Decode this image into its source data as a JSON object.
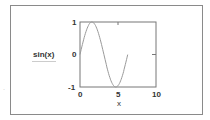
{
  "chart_data": {
    "type": "line",
    "title": "",
    "xlabel": "x",
    "ylabel": "sin(x)",
    "xlim": [
      0,
      10
    ],
    "ylim": [
      -1,
      1
    ],
    "xticks": [
      "0",
      "5",
      "10"
    ],
    "yticks": [
      "1",
      "0",
      "-1"
    ],
    "grid": false,
    "series": [
      {
        "name": "sin(x)",
        "function": "sin(x)",
        "x_range": [
          0,
          6.28
        ],
        "color": "#9a9a9a",
        "x": [
          0,
          0.785,
          1.571,
          2.356,
          3.142,
          3.927,
          4.712,
          5.498,
          6.283
        ],
        "values": [
          0,
          0.707,
          1,
          0.707,
          0,
          -0.707,
          -1,
          -0.707,
          0
        ]
      }
    ]
  },
  "labels": {
    "ylabel": "sin(x)",
    "xlabel": "x",
    "xtick_0": "0",
    "xtick_5": "5",
    "xtick_10": "10",
    "ytick_1": "1",
    "ytick_0": "0",
    "ytick_m1": "-1",
    "stray_mark": "·"
  }
}
